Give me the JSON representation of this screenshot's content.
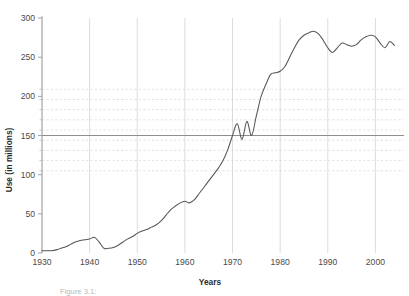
{
  "chart_data": {
    "type": "line",
    "title": "",
    "xlabel": "Years",
    "ylabel": "Use (in millions)",
    "xlim": [
      1930,
      2006
    ],
    "ylim": [
      0,
      300
    ],
    "grid": "vertical decade gridlines plus faint dashed horizontal gridlines between 100 and 210; one solid reference line at 150",
    "xticks": [
      1930,
      1940,
      1950,
      1960,
      1970,
      1980,
      1990,
      2000
    ],
    "xtick_labels": [
      "1930",
      "1940",
      "1950",
      "1960",
      "1970",
      "1980",
      "1990",
      "2000"
    ],
    "yticks": [
      0,
      50,
      100,
      150,
      200,
      250,
      300
    ],
    "ytick_labels": [
      "0",
      "50",
      "100",
      "150",
      "200",
      "250",
      "300"
    ],
    "minor_yticks": [
      105,
      118,
      131,
      144,
      157,
      170,
      183,
      196,
      209
    ],
    "reference_line": 150,
    "legend": "none",
    "series": [
      {
        "name": "Use",
        "x": [
          1930,
          1931,
          1932,
          1933,
          1934,
          1935,
          1936,
          1937,
          1938,
          1939,
          1940,
          1941,
          1942,
          1943,
          1944,
          1945,
          1946,
          1947,
          1948,
          1949,
          1950,
          1951,
          1952,
          1953,
          1954,
          1955,
          1956,
          1957,
          1958,
          1959,
          1960,
          1961,
          1962,
          1963,
          1964,
          1965,
          1966,
          1967,
          1968,
          1969,
          1970,
          1971,
          1972,
          1973,
          1974,
          1975,
          1976,
          1977,
          1978,
          1979,
          1980,
          1981,
          1982,
          1983,
          1984,
          1985,
          1986,
          1987,
          1988,
          1989,
          1990,
          1991,
          1992,
          1993,
          1994,
          1995,
          1996,
          1997,
          1998,
          1999,
          2000,
          2001,
          2002,
          2003,
          2004
        ],
        "values": [
          3,
          3,
          3,
          4,
          6,
          8,
          11,
          14,
          16,
          17,
          18,
          20,
          14,
          6,
          6,
          7,
          10,
          14,
          18,
          21,
          25,
          28,
          30,
          33,
          36,
          41,
          48,
          55,
          60,
          64,
          66,
          64,
          68,
          76,
          84,
          92,
          100,
          108,
          118,
          132,
          150,
          165,
          145,
          168,
          150,
          175,
          200,
          215,
          228,
          230,
          232,
          238,
          250,
          262,
          272,
          278,
          281,
          283,
          280,
          272,
          262,
          256,
          262,
          268,
          266,
          264,
          266,
          272,
          276,
          278,
          276,
          268,
          262,
          270,
          265
        ]
      }
    ]
  },
  "caption": {
    "text": "Figure 3.1:",
    "visible": "partially cut off at bottom edge"
  },
  "colors": {
    "line": "#555555",
    "gridline": "#d8d8d8",
    "dashed_gridline": "#e0c8c8",
    "reference_line": "#888888",
    "axis": "#999999",
    "tick_label": "#4a4a4a"
  }
}
